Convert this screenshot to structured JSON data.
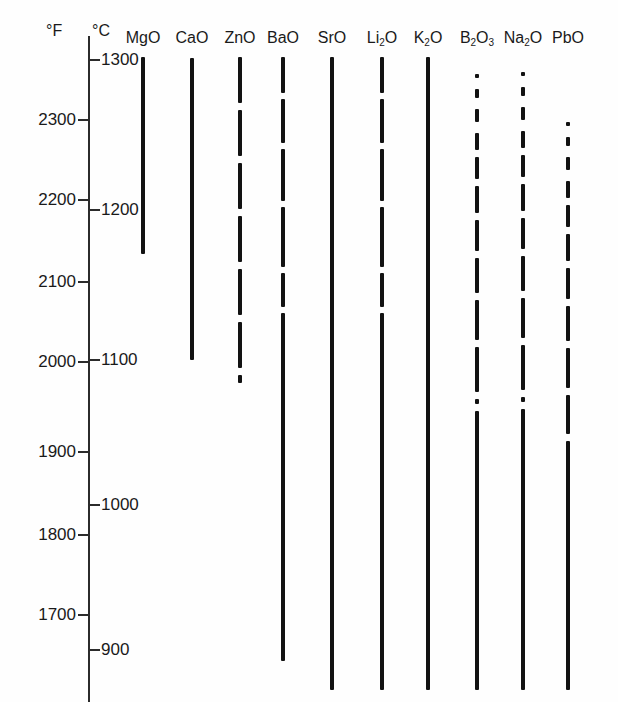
{
  "chart_data": {
    "type": "bar",
    "title": "",
    "subtitle": "",
    "orientation": "vertical-range-bars",
    "xlabel": "",
    "ylabel": "Temperature",
    "axes": [
      {
        "name": "fahrenheit",
        "unit": "°F",
        "side": "left",
        "ticks": [
          2300,
          2200,
          2100,
          2000,
          1900,
          1800,
          1700
        ],
        "tick_labels": [
          "2300",
          "2200",
          "2100",
          "2000",
          "1900",
          "1800",
          "1700"
        ],
        "tick_pixel_y": [
          120,
          200,
          282,
          362,
          452,
          535,
          615
        ],
        "range": [
          1660,
          2390
        ]
      },
      {
        "name": "celsius",
        "unit": "°C",
        "side": "left-inner",
        "ticks": [
          1300,
          1200,
          1100,
          1000,
          900
        ],
        "tick_labels": [
          "1300",
          "1200",
          "1100",
          "1000",
          "900"
        ],
        "tick_pixel_y": [
          60,
          210,
          360,
          505,
          650
        ],
        "range": [
          890,
          1320
        ]
      }
    ],
    "grid": false,
    "legend": false,
    "categories": [
      "MgO",
      "CaO",
      "ZnO",
      "BaO",
      "SrO",
      "Li2O",
      "K2O",
      "B2O3",
      "Na2O",
      "PbO"
    ],
    "category_labels": [
      "MgO",
      "CaO",
      "ZnO",
      "BaO",
      "SrO",
      "Li₂O",
      "K₂O",
      "B₂O₃",
      "Na₂O",
      "PbO"
    ],
    "series": [
      {
        "name": "Active melting range (°F)",
        "values_start_f": [
          2390,
          2390,
          2390,
          2390,
          2390,
          2390,
          2390,
          2370,
          2372,
          2315
        ],
        "values_end_f": [
          2190,
          2060,
          2058,
          1680,
          1650,
          1650,
          1650,
          1650,
          1650,
          1650
        ]
      }
    ],
    "bars": [
      {
        "label": "MgO",
        "label_display": "MgO",
        "x": 143,
        "top": 57,
        "bottom": 254,
        "pattern": "solid",
        "start_f": 2390,
        "end_f": 2190,
        "start_c": 1308,
        "end_c": 1200
      },
      {
        "label": "CaO",
        "label_display": "CaO",
        "x": 192,
        "top": 58,
        "bottom": 360,
        "pattern": "solid",
        "start_f": 2390,
        "end_f": 2060,
        "start_c": 1308,
        "end_c": 1100
      },
      {
        "label": "ZnO",
        "label_display": "ZnO",
        "x": 240,
        "top": 57,
        "bottom": 383,
        "pattern": "dashed-long",
        "start_f": 2390,
        "end_f": 2030,
        "start_c": 1308,
        "end_c": 1085
      },
      {
        "label": "BaO",
        "label_display": "BaO",
        "x": 283,
        "top": 57,
        "bottom": 661,
        "pattern": "dashed-to-solid",
        "start_f": 2390,
        "end_f": 1680,
        "start_c": 1308,
        "end_c": 915
      },
      {
        "label": "SrO",
        "label_display": "SrO",
        "x": 332,
        "top": 57,
        "bottom": 690,
        "pattern": "solid",
        "start_f": 2390,
        "end_f": 1650,
        "start_c": 1308,
        "end_c": 898
      },
      {
        "label": "Li2O",
        "label_display": "Li₂O",
        "x": 382,
        "top": 57,
        "bottom": 690,
        "pattern": "dashed-to-solid",
        "start_f": 2390,
        "end_f": 1650,
        "start_c": 1308,
        "end_c": 898
      },
      {
        "label": "K2O",
        "label_display": "K₂O",
        "x": 428,
        "top": 57,
        "bottom": 690,
        "pattern": "solid",
        "start_f": 2390,
        "end_f": 1650,
        "start_c": 1308,
        "end_c": 898
      },
      {
        "label": "B2O3",
        "label_display": "B₂O₃",
        "x": 477,
        "top": 74,
        "bottom": 690,
        "pattern": "dotted-to-solid",
        "start_f": 2370,
        "end_f": 1650,
        "start_c": 1297,
        "end_c": 898
      },
      {
        "label": "Na2O",
        "label_display": "Na₂O",
        "x": 523,
        "top": 72,
        "bottom": 690,
        "pattern": "dotted-to-solid",
        "start_f": 2372,
        "end_f": 1650,
        "start_c": 1298,
        "end_c": 898
      },
      {
        "label": "PbO",
        "label_display": "PbO",
        "x": 568,
        "top": 122,
        "bottom": 690,
        "pattern": "dotted-to-solid",
        "start_f": 2315,
        "end_f": 1650,
        "start_c": 1268,
        "end_c": 898
      }
    ]
  },
  "axis": {
    "unit_f": "°F",
    "unit_c": "°C",
    "f_ticks": [
      {
        "label": "2300",
        "y": 120
      },
      {
        "label": "2200",
        "y": 200
      },
      {
        "label": "2100",
        "y": 282
      },
      {
        "label": "2000",
        "y": 362
      },
      {
        "label": "1900",
        "y": 452
      },
      {
        "label": "1800",
        "y": 535
      },
      {
        "label": "1700",
        "y": 615
      }
    ],
    "c_ticks": [
      {
        "label": "1300",
        "y": 60
      },
      {
        "label": "1200",
        "y": 210
      },
      {
        "label": "1100",
        "y": 360
      },
      {
        "label": "1000",
        "y": 505
      },
      {
        "label": "900",
        "y": 650
      }
    ]
  },
  "colors": {
    "ink": "#121212",
    "axis": "#2b2b2b",
    "background": "#fefefe"
  }
}
